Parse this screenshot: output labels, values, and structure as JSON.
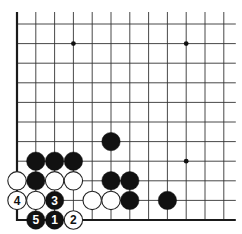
{
  "board": {
    "title": "Go board diagram (lower-left corner)",
    "columns": 12,
    "rows": 11,
    "origin_x": 17,
    "origin_y": 24,
    "col_step": 18.8,
    "row_step": 19.6,
    "stone_radius": 9.2,
    "edges": [
      "left",
      "bottom"
    ],
    "colors": {
      "line": "#333333",
      "edge": "#1a1a1a",
      "black_stone": "#111111",
      "white_stone": "#ffffff",
      "white_outline": "#222222",
      "black_label": "#ffffff",
      "white_label": "#111111"
    },
    "hoshi": [
      {
        "col": 3,
        "row": 1
      },
      {
        "col": 9,
        "row": 1
      },
      {
        "col": 9,
        "row": 7
      }
    ],
    "stones": [
      {
        "color": "black",
        "col": 1,
        "row": 7,
        "label": ""
      },
      {
        "color": "black",
        "col": 2,
        "row": 7,
        "label": ""
      },
      {
        "color": "black",
        "col": 3,
        "row": 7,
        "label": ""
      },
      {
        "color": "black",
        "col": 5,
        "row": 6,
        "label": ""
      },
      {
        "color": "white",
        "col": 0,
        "row": 8,
        "label": ""
      },
      {
        "color": "black",
        "col": 1,
        "row": 8,
        "label": ""
      },
      {
        "color": "white",
        "col": 2,
        "row": 8,
        "label": ""
      },
      {
        "color": "white",
        "col": 3,
        "row": 8,
        "label": ""
      },
      {
        "color": "black",
        "col": 5,
        "row": 8,
        "label": ""
      },
      {
        "color": "black",
        "col": 6,
        "row": 8,
        "label": ""
      },
      {
        "color": "white",
        "col": 0,
        "row": 9,
        "label": "4"
      },
      {
        "color": "white",
        "col": 1,
        "row": 9,
        "label": ""
      },
      {
        "color": "black",
        "col": 2,
        "row": 9,
        "label": "3"
      },
      {
        "color": "white",
        "col": 4,
        "row": 9,
        "label": ""
      },
      {
        "color": "white",
        "col": 5,
        "row": 9,
        "label": ""
      },
      {
        "color": "black",
        "col": 6,
        "row": 9,
        "label": ""
      },
      {
        "color": "black",
        "col": 8,
        "row": 9,
        "label": ""
      },
      {
        "color": "black",
        "col": 1,
        "row": 10,
        "label": "5"
      },
      {
        "color": "black",
        "col": 2,
        "row": 10,
        "label": "1"
      },
      {
        "color": "white",
        "col": 3,
        "row": 10,
        "label": "2"
      }
    ],
    "move_sequence": [
      "1",
      "2",
      "3",
      "4",
      "5"
    ]
  }
}
